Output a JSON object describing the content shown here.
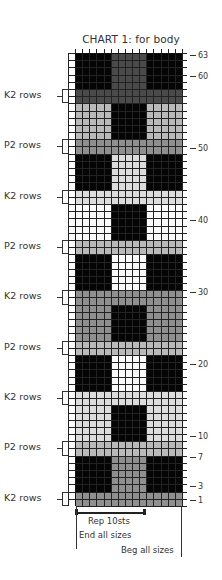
{
  "chart": {
    "title": "CHART 1: for body",
    "total_rows": 63,
    "stitches": 15,
    "colors": {
      "black": "#050505",
      "dark_gray": "#4a4a4a",
      "gray": "#8f8f8f",
      "light_gray": "#b9b9b9",
      "pale": "#dcdcdc",
      "white": "#fafafa"
    },
    "row_labels": [
      {
        "row": 63,
        "label": "63"
      },
      {
        "row": 60,
        "label": "60"
      },
      {
        "row": 50,
        "label": "50"
      },
      {
        "row": 40,
        "label": "40"
      },
      {
        "row": 30,
        "label": "30"
      },
      {
        "row": 20,
        "label": "20"
      },
      {
        "row": 10,
        "label": "10"
      },
      {
        "row": 7,
        "label": "7"
      },
      {
        "row": 3,
        "label": "3"
      },
      {
        "row": 1,
        "label": "1"
      }
    ],
    "side_labels": [
      {
        "rows": [
          57,
          58
        ],
        "label": "K2 rows"
      },
      {
        "rows": [
          50,
          51
        ],
        "label": "P2 rows"
      },
      {
        "rows": [
          43,
          44
        ],
        "label": "K2 rows"
      },
      {
        "rows": [
          36,
          37
        ],
        "label": "P2 rows"
      },
      {
        "rows": [
          29,
          30
        ],
        "label": "K2 rows"
      },
      {
        "rows": [
          22,
          23
        ],
        "label": "P2 rows"
      },
      {
        "rows": [
          15,
          16
        ],
        "label": "K2 rows"
      },
      {
        "rows": [
          8,
          9
        ],
        "label": "P2 rows"
      },
      {
        "rows": [
          1,
          2
        ],
        "label": "K2 rows"
      }
    ],
    "bands": [
      {
        "rows": [
          1,
          2
        ],
        "type": "stripe",
        "fill": "gray"
      },
      {
        "rows": [
          3,
          7
        ],
        "type": "block",
        "sides": "black",
        "center": "gray"
      },
      {
        "rows": [
          8,
          9
        ],
        "type": "stripe",
        "fill": "light_gray"
      },
      {
        "rows": [
          10,
          14
        ],
        "type": "block",
        "sides": "pale",
        "center": "black"
      },
      {
        "rows": [
          15,
          16
        ],
        "type": "stripe",
        "fill": "pale"
      },
      {
        "rows": [
          17,
          21
        ],
        "type": "block",
        "sides": "black",
        "center": "white"
      },
      {
        "rows": [
          22,
          23
        ],
        "type": "stripe",
        "fill": "light_gray"
      },
      {
        "rows": [
          24,
          28
        ],
        "type": "block",
        "sides": "gray",
        "center": "black"
      },
      {
        "rows": [
          29,
          30
        ],
        "type": "stripe",
        "fill": "gray"
      },
      {
        "rows": [
          31,
          35
        ],
        "type": "block",
        "sides": "black",
        "center": "white"
      },
      {
        "rows": [
          36,
          37
        ],
        "type": "stripe",
        "fill": "light_gray"
      },
      {
        "rows": [
          38,
          42
        ],
        "type": "block",
        "sides": "white",
        "center": "black"
      },
      {
        "rows": [
          43,
          44
        ],
        "type": "stripe",
        "fill": "pale"
      },
      {
        "rows": [
          45,
          49
        ],
        "type": "block",
        "sides": "black",
        "center": "pale"
      },
      {
        "rows": [
          50,
          51
        ],
        "type": "stripe",
        "fill": "gray"
      },
      {
        "rows": [
          52,
          56
        ],
        "type": "block",
        "sides": "light_gray",
        "center": "black"
      },
      {
        "rows": [
          57,
          58
        ],
        "type": "stripe",
        "fill": "dark_gray"
      },
      {
        "rows": [
          59,
          63
        ],
        "type": "block",
        "sides": "black",
        "center": "dark_gray"
      }
    ],
    "footer": {
      "repeat": "Rep 10sts",
      "end": "End all sizes",
      "beg": "Beg all sizes"
    }
  }
}
